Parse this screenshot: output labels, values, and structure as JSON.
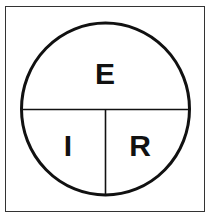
{
  "diagram": {
    "labels": {
      "top": "E",
      "bottom_left": "I",
      "bottom_right": "R"
    },
    "colors": {
      "stroke": "#111111",
      "background": "#ffffff"
    }
  }
}
